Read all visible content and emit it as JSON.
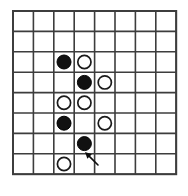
{
  "figure": {
    "board_type": "go-board",
    "background_color": "#ffffff",
    "line_color": "#3d3d3d",
    "black_stone_color": "#111111",
    "white_stone_color": "#ffffff"
  },
  "board": {
    "columns": 8,
    "rows": 8,
    "origin_x": 13,
    "origin_y": 11,
    "cell_size": 20.4,
    "column_labels": [
      "1",
      "2",
      "3",
      "4",
      "5",
      "6",
      "7",
      "8"
    ],
    "row_labels": [
      "1",
      "2",
      "3",
      "4",
      "5",
      "6",
      "7",
      "8"
    ]
  },
  "stones": [
    {
      "id": "stone-b1",
      "color": "black",
      "col": 3,
      "row": 3,
      "label": "black stone at column 3 row 3"
    },
    {
      "id": "stone-w1",
      "color": "white",
      "col": 4,
      "row": 3,
      "label": "white stone at column 4 row 3"
    },
    {
      "id": "stone-b2",
      "color": "black",
      "col": 4,
      "row": 4,
      "label": "black stone at column 4 row 4"
    },
    {
      "id": "stone-w2",
      "color": "white",
      "col": 5,
      "row": 4,
      "label": "white stone at column 5 row 4"
    },
    {
      "id": "stone-w3",
      "color": "white",
      "col": 3,
      "row": 5,
      "label": "white stone at column 3 row 5"
    },
    {
      "id": "stone-w4",
      "color": "white",
      "col": 4,
      "row": 5,
      "label": "white stone at column 4 row 5"
    },
    {
      "id": "stone-b3",
      "color": "black",
      "col": 3,
      "row": 6,
      "label": "black stone at column 3 row 6"
    },
    {
      "id": "stone-w5",
      "color": "white",
      "col": 5,
      "row": 6,
      "label": "white stone at column 5 row 6"
    },
    {
      "id": "stone-b4",
      "color": "black",
      "col": 4,
      "row": 7,
      "label": "black stone at column 4 row 7"
    },
    {
      "id": "stone-w6",
      "color": "white",
      "col": 3,
      "row": 8,
      "label": "white stone at column 3 row 8"
    }
  ],
  "annotations": [
    {
      "id": "move-arrow",
      "type": "arrow",
      "points_to": {
        "col": 4,
        "row": 7
      },
      "from_x": 98,
      "from_y": 165,
      "to_x": 85,
      "to_y": 152,
      "label": "arrow indicating last move"
    }
  ],
  "stone_radius": {
    "black": 7.0,
    "white": 6.6
  }
}
